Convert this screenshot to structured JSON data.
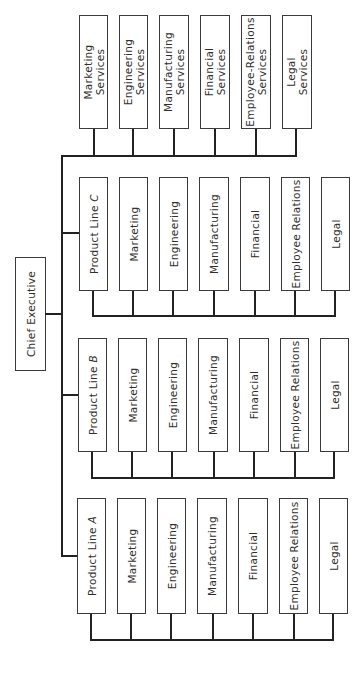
{
  "chart_title": "",
  "chief": {
    "label": "Chief Executive"
  },
  "services": [
    {
      "line1": "Marketing",
      "line2": "Services"
    },
    {
      "line1": "Engineering",
      "line2": "Services"
    },
    {
      "line1": "Manufacturing",
      "line2": "Services"
    },
    {
      "line1": "Financial",
      "line2": "Services"
    },
    {
      "line1": "Employee-Relations",
      "line2": "Services"
    },
    {
      "line1": "Legal",
      "line2": "Services"
    }
  ],
  "product_lines": [
    {
      "name": "Product Line",
      "letter": "C",
      "departments": [
        "Marketing",
        "Engineering",
        "Manufacturing",
        "Financial",
        "Employee Relations",
        "Legal"
      ]
    },
    {
      "name": "Product Line",
      "letter": "B",
      "departments": [
        "Marketing",
        "Engineering",
        "Manufacturing",
        "Financial",
        "Employee Relations",
        "Legal"
      ]
    },
    {
      "name": "Product Line",
      "letter": "A",
      "departments": [
        "Marketing",
        "Engineering",
        "Manufacturing",
        "Financial",
        "Employee Relations",
        "Legal"
      ]
    }
  ],
  "colors": {
    "line": "#222222",
    "box_border": "#3a3a3a",
    "text": "#2f2f2f",
    "background": "#ffffff"
  }
}
